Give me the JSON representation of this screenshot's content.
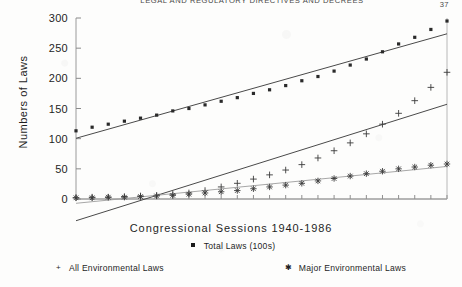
{
  "page": {
    "running_head": "LEGAL AND REGULATORY DIRECTIVES AND DECREES",
    "page_number": "37"
  },
  "chart_data": {
    "type": "scatter",
    "title": "",
    "xlabel": "Congressional Sessions 1940-1986",
    "ylabel": "Numbers of Laws",
    "ylim": [
      0,
      300
    ],
    "yticks": [
      0,
      50,
      100,
      150,
      200,
      250,
      300
    ],
    "ytick_labels": [
      "0",
      "50",
      "100",
      "150",
      "200",
      "250",
      "300"
    ],
    "xlim": [
      1,
      24
    ],
    "xtick_count": 24,
    "xtick_labels": [],
    "grid": false,
    "legend_position": "below",
    "series": [
      {
        "name": "Total Laws (100s)",
        "marker": "square",
        "trendline": true,
        "x": [
          1,
          2,
          3,
          4,
          5,
          6,
          7,
          8,
          9,
          10,
          11,
          12,
          13,
          14,
          15,
          16,
          17,
          18,
          19,
          20,
          21,
          22,
          23,
          24
        ],
        "values": [
          113,
          119,
          124,
          129,
          134,
          139,
          146,
          150,
          156,
          162,
          168,
          175,
          181,
          188,
          196,
          203,
          212,
          222,
          232,
          244,
          257,
          268,
          281,
          295
        ]
      },
      {
        "name": "All Environmental Laws",
        "marker": "plus",
        "trendline": true,
        "x": [
          1,
          2,
          3,
          4,
          5,
          6,
          7,
          8,
          9,
          10,
          11,
          12,
          13,
          14,
          15,
          16,
          17,
          18,
          19,
          20,
          21,
          22,
          23,
          24
        ],
        "values": [
          2,
          3,
          3,
          4,
          5,
          6,
          8,
          10,
          14,
          20,
          26,
          33,
          40,
          48,
          57,
          68,
          80,
          93,
          108,
          124,
          142,
          163,
          185,
          210
        ]
      },
      {
        "name": "Major Environmental Laws",
        "marker": "asterisk",
        "trendline": true,
        "x": [
          1,
          2,
          3,
          4,
          5,
          6,
          7,
          8,
          9,
          10,
          11,
          12,
          13,
          14,
          15,
          16,
          17,
          18,
          19,
          20,
          21,
          22,
          23,
          24
        ],
        "values": [
          2,
          2,
          3,
          3,
          4,
          5,
          6,
          8,
          10,
          12,
          14,
          17,
          20,
          23,
          26,
          30,
          34,
          38,
          42,
          46,
          50,
          53,
          56,
          58
        ]
      }
    ]
  },
  "legend": {
    "total_laws": "Total Laws (100s)",
    "all_env": "All Environmental Laws",
    "major_env": "Major Environmental Laws"
  }
}
